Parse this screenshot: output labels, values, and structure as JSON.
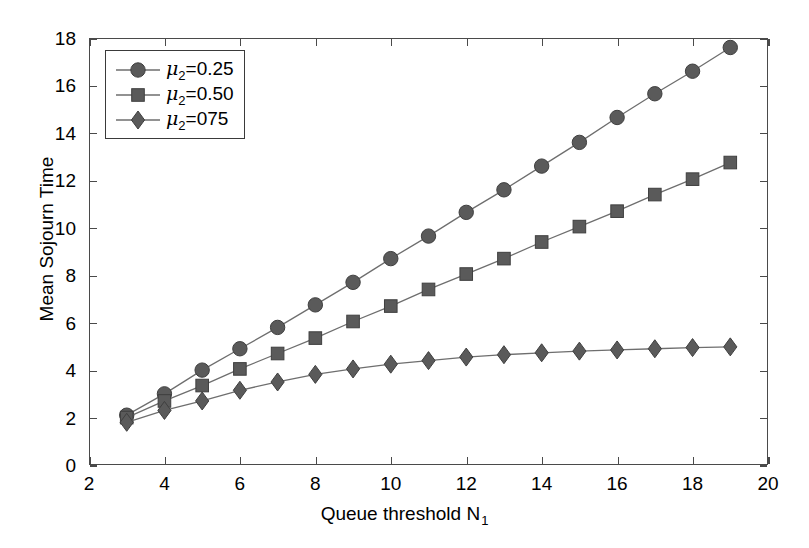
{
  "chart_data": {
    "type": "line",
    "title": "",
    "xlabel": "Queue threshold N",
    "xlabel_sub": "1",
    "ylabel": "Mean Sojourn Time",
    "xlim": [
      2,
      20
    ],
    "ylim": [
      0,
      18
    ],
    "xticks": [
      2,
      4,
      6,
      8,
      10,
      12,
      14,
      16,
      18,
      20
    ],
    "yticks": [
      0,
      2,
      4,
      6,
      8,
      10,
      12,
      14,
      16,
      18
    ],
    "grid": false,
    "legend_position": "upper left",
    "background": "#ffffff",
    "line_color": "#6e6e6e",
    "marker_color": "#5a5a5a",
    "axis_color": "#4a4a4a",
    "x": [
      3,
      4,
      5,
      6,
      7,
      8,
      9,
      10,
      11,
      12,
      13,
      14,
      15,
      16,
      17,
      18,
      19
    ],
    "series": [
      {
        "name": "mu2=0.25",
        "label_prefix": "",
        "label_mu": "μ",
        "label_sub": "2",
        "label_suffix": "=0.25",
        "marker": "circle",
        "color": "#5a5a5a",
        "values": [
          2.1,
          3.0,
          4.0,
          4.9,
          5.8,
          6.75,
          7.7,
          8.7,
          9.65,
          10.65,
          11.6,
          12.6,
          13.6,
          14.65,
          15.65,
          16.6,
          17.6
        ]
      },
      {
        "name": "mu2=0.50",
        "label_prefix": "",
        "label_mu": "μ",
        "label_sub": "2",
        "label_suffix": "=0.50",
        "marker": "square",
        "color": "#5a5a5a",
        "values": [
          2.0,
          2.7,
          3.35,
          4.05,
          4.7,
          5.35,
          6.05,
          6.7,
          7.4,
          8.05,
          8.7,
          9.4,
          10.05,
          10.7,
          11.4,
          12.05,
          12.75
        ]
      },
      {
        "name": "mu2=075",
        "label_prefix": "",
        "label_mu": "μ",
        "label_sub": "2",
        "label_suffix": "=075",
        "marker": "diamond",
        "color": "#5a5a5a",
        "values": [
          1.8,
          2.3,
          2.7,
          3.15,
          3.5,
          3.82,
          4.05,
          4.25,
          4.4,
          4.55,
          4.65,
          4.73,
          4.8,
          4.85,
          4.9,
          4.95,
          4.98
        ]
      }
    ]
  },
  "legend": {
    "entries": [
      {
        "text": "=0.25",
        "mu": "μ",
        "sub": "2",
        "marker": "circle"
      },
      {
        "text": "=0.50",
        "mu": "μ",
        "sub": "2",
        "marker": "square"
      },
      {
        "text": "=075",
        "mu": "μ",
        "sub": "2",
        "marker": "diamond"
      }
    ]
  }
}
